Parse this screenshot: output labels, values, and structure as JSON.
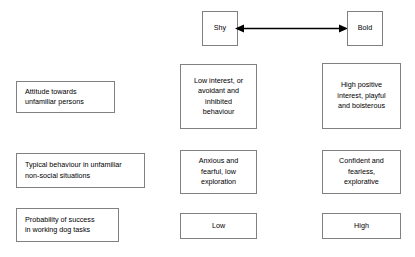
{
  "diagram": {
    "title_axis": {
      "left_pole": "Shy",
      "right_pole": "Bold",
      "connector": "double-headed-arrow"
    },
    "rows": [
      {
        "label": "Attitude towards\nunfamiliar persons",
        "shy": "Low interest, or\navoidant and\ninhibited\nbehaviour",
        "bold": "High positive\ninterest, playful\nand boisterous"
      },
      {
        "label": "Typical behaviour in unfamiliar\nnon-social situations",
        "shy": "Anxious and\nfearful, low\nexploration",
        "bold": "Confident and\nfearless,\nexplorative"
      },
      {
        "label": "Probability of success\nin working dog tasks",
        "shy": "Low",
        "bold": "High"
      }
    ],
    "colors": {
      "box_border": "#808080",
      "text": "#000000",
      "background": "#ffffff",
      "arrow": "#000000"
    }
  }
}
